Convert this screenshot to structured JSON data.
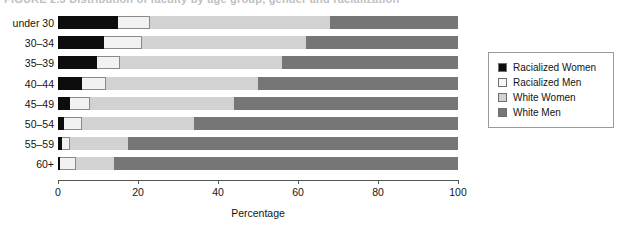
{
  "figure": {
    "title_clipped": "FIGURE 2.3   Distribution of faculty by age group, gender and racialization"
  },
  "chart_data": {
    "type": "bar",
    "orientation": "horizontal",
    "stacked": true,
    "stack_total": 100,
    "title": "",
    "xlabel": "Percentage",
    "ylabel": "",
    "xlim": [
      0,
      100
    ],
    "xticks": [
      0,
      20,
      40,
      60,
      80,
      100
    ],
    "xtick_labels": [
      "0",
      "20",
      "40",
      "60",
      "80",
      "100"
    ],
    "grid": false,
    "legend_position": "right",
    "categories": [
      "under 30",
      "30–34",
      "35–39",
      "40–44",
      "45–49",
      "50–54",
      "55–59",
      "60+"
    ],
    "series": [
      {
        "name": "Racialized Women",
        "color": "#0d0d0d",
        "values": [
          15,
          11.5,
          9.7,
          6,
          3,
          1.5,
          1,
          0.4
        ]
      },
      {
        "name": "Racialized Men",
        "color": "#f2f2f2",
        "values": [
          8,
          9.5,
          5.8,
          6,
          5,
          4.5,
          2,
          4.1
        ]
      },
      {
        "name": "White Women",
        "color": "#d2d2d2",
        "values": [
          45,
          41,
          40.5,
          38,
          36,
          28,
          14.5,
          9.5
        ]
      },
      {
        "name": "White Men",
        "color": "#767676",
        "values": [
          32,
          38,
          44,
          50,
          56,
          66,
          82.5,
          86
        ]
      }
    ]
  },
  "legend": {
    "items": [
      {
        "label": "Racialized Women",
        "color": "#0d0d0d"
      },
      {
        "label": "Racialized Men",
        "color": "#f7f7f7"
      },
      {
        "label": "White Women",
        "color": "#d2d2d2"
      },
      {
        "label": "White Men",
        "color": "#767676"
      }
    ]
  }
}
